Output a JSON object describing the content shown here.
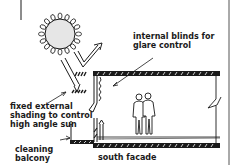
{
  "diagram": {
    "type": "architectural-section",
    "labels": {
      "internal_blinds": [
        "internal blinds for",
        "glare control"
      ],
      "external_shading": [
        "fixed external",
        "shading to control",
        "high angle sun"
      ],
      "cleaning_balcony": [
        "cleaning",
        "balcony"
      ],
      "facade": "south facade"
    },
    "elements": [
      "sun",
      "incident-sun-ray",
      "reflected-sun-ray",
      "external-shading-louvres",
      "internal-blinds",
      "floor-slab",
      "ceiling-slab",
      "two-occupants",
      "cleaning-balcony",
      "break-line"
    ],
    "colors": {
      "ink": "#1a1a1a",
      "background": "#ffffff",
      "sun_fill": "#e6e6e6"
    }
  }
}
